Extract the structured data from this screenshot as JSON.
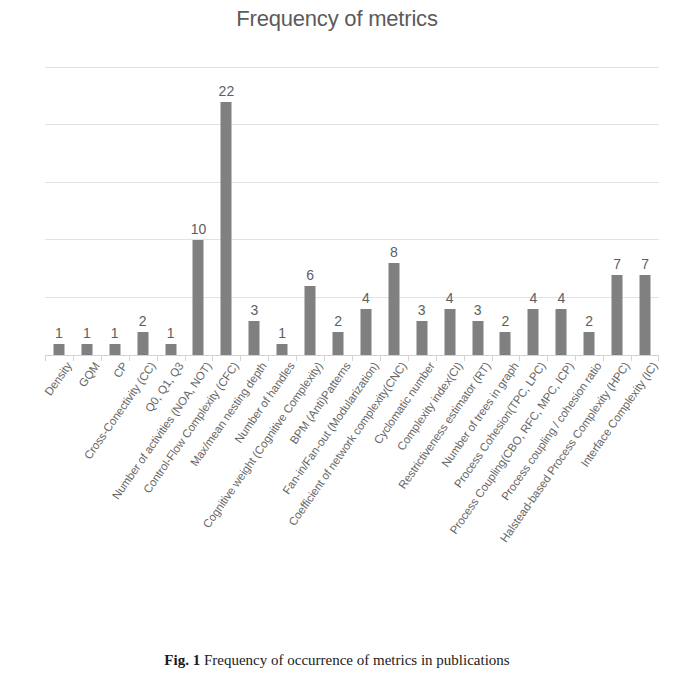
{
  "chart_data": {
    "type": "bar",
    "title": "Frequency of metrics",
    "xlabel": "",
    "ylabel": "",
    "ylim": [
      0,
      25
    ],
    "grid": true,
    "gridline_values": [
      5,
      10,
      15,
      20,
      25
    ],
    "legend": null,
    "bar_color": "#808080",
    "categories": [
      "Density",
      "GQM",
      "CP",
      "Cross-Conectivity (CC)",
      "Q0, Q1, Q3",
      "Number of activities (NOA, NOT)",
      "Control-Flow Complexity (CFC)",
      "Max/mean nesting depth",
      "Number of handles",
      "Cognitive weight (Cognitive Complexity)",
      "BPM (Anti)Patterns",
      "Fan-in/Fan-out (Modularization)",
      "Coefficient of network complexity(CNC)",
      "Cyclomatic number",
      "Complexity index(CI)",
      "Restrictiveness estimator (RT)",
      "Number of trees in graph",
      "Process Cohesion(TPC, LPC)",
      "Process Coupling(CBO, RFC, MPC, ICP)",
      "Process coupling / cohesion ratio",
      "Halstead-based Process Complexity (HPC)",
      "Interface Complexity (IC)"
    ],
    "values": [
      1,
      1,
      1,
      2,
      1,
      10,
      22,
      3,
      1,
      6,
      2,
      4,
      8,
      3,
      4,
      3,
      2,
      4,
      4,
      2,
      7,
      7
    ]
  },
  "caption": {
    "figure_number": "Fig. 1",
    "text": "Frequency of occurrence of metrics in publications"
  }
}
